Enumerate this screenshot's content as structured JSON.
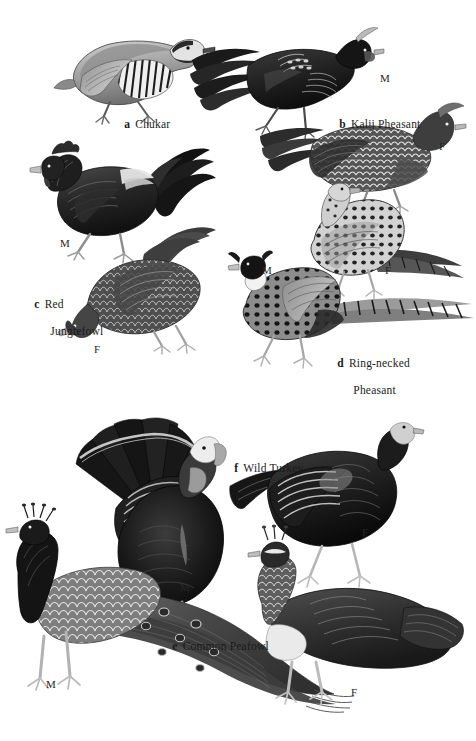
{
  "plate": {
    "title": "Gamebirds plate",
    "background_color": "#ffffff",
    "ink_color": "#1b1b1b",
    "width": 476,
    "height": 741,
    "style": "grayscale scratchboard / engraving field-guide illustration"
  },
  "species": [
    {
      "key": "a",
      "name": "Chukar",
      "caption_lines": [
        "Chukar"
      ],
      "caption_x": 112,
      "caption_y": 104,
      "sexes": []
    },
    {
      "key": "b",
      "name": "Kalij Pheasant",
      "caption_lines": [
        "Kalij Pheasant"
      ],
      "caption_x": 327,
      "caption_y": 104,
      "sexes": [
        {
          "label": "M",
          "x": 380,
          "y": 72
        },
        {
          "label": "F",
          "x": 439,
          "y": 140
        }
      ]
    },
    {
      "key": "c",
      "name": "Red Junglefowl",
      "caption_lines": [
        "Red",
        "Junglefowl"
      ],
      "caption_x": 22,
      "caption_y": 284,
      "sexes": [
        {
          "label": "M",
          "x": 60,
          "y": 237
        },
        {
          "label": "F",
          "x": 94,
          "y": 343
        }
      ]
    },
    {
      "key": "d",
      "name": "Ring-necked Pheasant",
      "caption_lines": [
        "Ring-necked",
        "Pheasant"
      ],
      "caption_x": 325,
      "caption_y": 343,
      "sexes": [
        {
          "label": "M",
          "x": 262,
          "y": 264
        },
        {
          "label": "F",
          "x": 385,
          "y": 264
        }
      ]
    },
    {
      "key": "e",
      "name": "Common Peafowl",
      "caption_lines": [
        "Common Peafowl"
      ],
      "caption_x": 160,
      "caption_y": 626,
      "sexes": [
        {
          "label": "M",
          "x": 46,
          "y": 678
        },
        {
          "label": "F",
          "x": 351,
          "y": 686
        }
      ]
    },
    {
      "key": "f",
      "name": "Wild Turkey",
      "caption_lines": [
        "Wild Turkey"
      ],
      "caption_x": 222,
      "caption_y": 448,
      "sexes": [
        {
          "label": "M",
          "x": 180,
          "y": 581
        },
        {
          "label": "F",
          "x": 362,
          "y": 526
        }
      ]
    }
  ]
}
